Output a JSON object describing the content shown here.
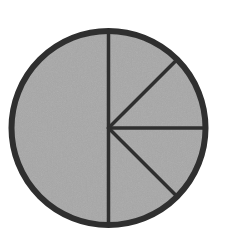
{
  "diagram": {
    "type": "fraction-circle",
    "center": {
      "x": 108.5,
      "y": 128
    },
    "radius": 97,
    "fill_color": "#a7a7a7",
    "stroke_color": "#2f2f2f",
    "outer_stroke_width": 6,
    "spoke_stroke_width": 3.5,
    "spokes_deg": [
      0,
      45,
      90,
      135,
      180
    ],
    "regions": [
      {
        "name": "left-half",
        "fraction": "1/2"
      },
      {
        "name": "right-eighth-1",
        "fraction": "1/8"
      },
      {
        "name": "right-eighth-2",
        "fraction": "1/8"
      },
      {
        "name": "right-eighth-3",
        "fraction": "1/8"
      },
      {
        "name": "right-eighth-4",
        "fraction": "1/8"
      }
    ]
  }
}
